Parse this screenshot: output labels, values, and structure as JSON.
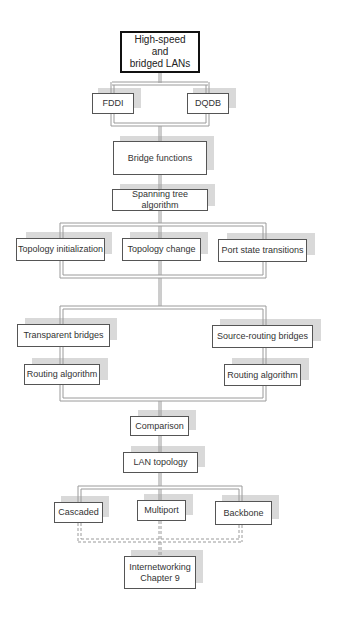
{
  "diagram": {
    "type": "flowchart",
    "nodes": {
      "root": "High-speed\nand\nbridged LANs",
      "fddi": "FDDI",
      "dqdb": "DQDB",
      "bridge_functions": "Bridge functions",
      "spanning_tree": "Spanning tree algorithm",
      "topology_init": "Topology initialization",
      "topology_change": "Topology change",
      "port_state": "Port state transitions",
      "transparent": "Transparent bridges",
      "routing_left": "Routing algorithm",
      "source_routing": "Source-routing bridges",
      "routing_right": "Routing algorithm",
      "comparison": "Comparison",
      "lan_topology": "LAN topology",
      "cascaded": "Cascaded",
      "multiport": "Multiport",
      "backbone": "Backbone",
      "internetworking": "Internetworking\nChapter 9"
    },
    "edges": [
      [
        "root",
        "fddi"
      ],
      [
        "root",
        "dqdb"
      ],
      [
        "fddi",
        "bridge_functions"
      ],
      [
        "dqdb",
        "bridge_functions"
      ],
      [
        "bridge_functions",
        "spanning_tree"
      ],
      [
        "spanning_tree",
        "topology_init"
      ],
      [
        "spanning_tree",
        "topology_change"
      ],
      [
        "spanning_tree",
        "port_state"
      ],
      [
        "topology_init",
        "transparent"
      ],
      [
        "topology_change",
        "transparent"
      ],
      [
        "port_state",
        "source_routing"
      ],
      [
        "transparent",
        "routing_left"
      ],
      [
        "source_routing",
        "routing_right"
      ],
      [
        "routing_left",
        "comparison"
      ],
      [
        "routing_right",
        "comparison"
      ],
      [
        "comparison",
        "lan_topology"
      ],
      [
        "lan_topology",
        "cascaded"
      ],
      [
        "lan_topology",
        "multiport"
      ],
      [
        "lan_topology",
        "backbone"
      ],
      [
        "cascaded",
        "internetworking",
        "dashed"
      ],
      [
        "multiport",
        "internetworking",
        "dashed"
      ],
      [
        "backbone",
        "internetworking",
        "dashed"
      ]
    ]
  }
}
